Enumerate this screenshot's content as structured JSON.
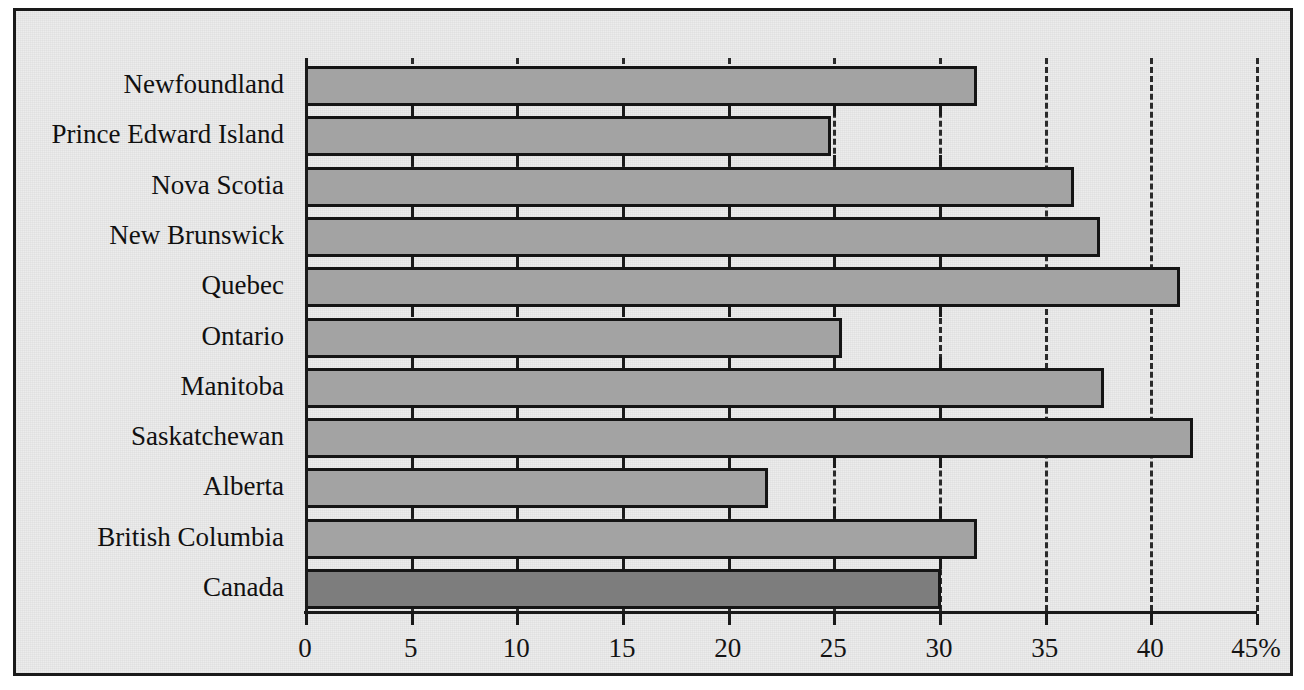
{
  "chart_data": {
    "type": "bar",
    "orientation": "horizontal",
    "title": "",
    "subtitle": "",
    "xlabel": "",
    "ylabel": "",
    "categories": [
      "Newfoundland",
      "Prince Edward Island",
      "Nova Scotia",
      "New Brunswick",
      "Quebec",
      "Ontario",
      "Manitoba",
      "Saskatchewan",
      "Alberta",
      "British Columbia",
      "Canada"
    ],
    "values": [
      31.8,
      24.9,
      36.4,
      37.6,
      41.4,
      25.4,
      37.8,
      42.0,
      21.9,
      31.8,
      30.1
    ],
    "xlim": [
      0,
      45
    ],
    "xticks": [
      0,
      5,
      10,
      15,
      20,
      25,
      30,
      35,
      40,
      45
    ],
    "xticklabels": [
      "0",
      "5",
      "10",
      "15",
      "20",
      "25",
      "30",
      "35",
      "40",
      "45%"
    ],
    "gridlines_at": [
      5,
      10,
      15,
      20,
      25,
      30,
      35,
      40,
      45
    ],
    "grid": "dashed-vertical",
    "legend": "none",
    "units": "percent",
    "highlight_category": "Canada",
    "colors": {
      "background": "#ececec",
      "bar_fill": "#a3a3a3",
      "bar_highlight_fill": "#7d7d7d",
      "bar_edge": "#151515",
      "axis": "#1a1a1a",
      "grid": "#2b2b2b",
      "text": "#101010",
      "frame": "#1a1a1a"
    }
  }
}
